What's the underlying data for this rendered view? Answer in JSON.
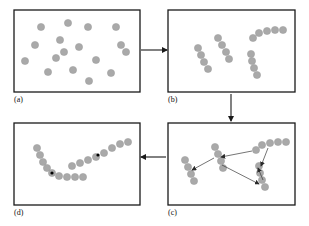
{
  "figure": {
    "background_color": "#ffffff",
    "panel_border_color": "#1a1a1a",
    "dot_color": "#a9a9a9",
    "dot_stroke_color": "#9a9a9a",
    "seed_dot_color": "#000000",
    "arrow_color": "#1a1a1a",
    "inner_arrow_color": "#3a3a3a",
    "dot_radius": 3.6,
    "seed_dot_radius": 1.6,
    "label_color": "#111111"
  },
  "panels": [
    {
      "id": "a",
      "label": "(a)",
      "caption_position": "below-left",
      "box": {
        "x": 14,
        "y": 10,
        "width": 126,
        "height": 82
      },
      "stage": "scattered unlabeled points"
    },
    {
      "id": "b",
      "label": "(b)",
      "caption_position": "below-left",
      "box": {
        "x": 168,
        "y": 10,
        "width": 127,
        "height": 82
      },
      "stage": "points grouped into short chains"
    },
    {
      "id": "c",
      "label": "(c)",
      "caption_position": "below-left",
      "box": {
        "x": 168,
        "y": 123,
        "width": 127,
        "height": 82
      },
      "stage": "chains linked by directed arrows"
    },
    {
      "id": "d",
      "label": "(d)",
      "caption_position": "below-left",
      "box": {
        "x": 14,
        "y": 123,
        "width": 126,
        "height": 82
      },
      "stage": "merged continuous curves"
    }
  ],
  "flow_arrows": [
    {
      "name": "a-to-b",
      "from": "a",
      "to": "b",
      "x1": 141,
      "y1": 50,
      "x2": 167,
      "y2": 50,
      "direction": "right"
    },
    {
      "name": "b-to-c",
      "from": "b",
      "to": "c",
      "x1": 231,
      "y1": 94,
      "x2": 231,
      "y2": 121,
      "direction": "down"
    },
    {
      "name": "c-to-d",
      "from": "c",
      "to": "d",
      "x1": 166,
      "y1": 157,
      "x2": 141,
      "y2": 157,
      "direction": "left"
    }
  ],
  "panel_a_points": [
    [
      41,
      27
    ],
    [
      68,
      23
    ],
    [
      88,
      27
    ],
    [
      116,
      27
    ],
    [
      60,
      40
    ],
    [
      35,
      45
    ],
    [
      79,
      47
    ],
    [
      121,
      45
    ],
    [
      25,
      61
    ],
    [
      56,
      58
    ],
    [
      96,
      60
    ],
    [
      126,
      52
    ],
    [
      48,
      72
    ],
    [
      73,
      70
    ],
    [
      111,
      73
    ],
    [
      89,
      81
    ],
    [
      64,
      52
    ]
  ],
  "panel_b_chains": [
    {
      "name": "chain-left",
      "points": [
        [
          198,
          48
        ],
        [
          201,
          55
        ],
        [
          204,
          62
        ],
        [
          208,
          69
        ]
      ]
    },
    {
      "name": "chain-mid",
      "points": [
        [
          218,
          38
        ],
        [
          222,
          45
        ],
        [
          226,
          52
        ],
        [
          229,
          59
        ]
      ]
    },
    {
      "name": "chain-top-right",
      "points": [
        [
          253,
          38
        ],
        [
          259,
          33
        ],
        [
          267,
          31
        ],
        [
          275,
          30
        ],
        [
          283,
          30
        ]
      ]
    },
    {
      "name": "chain-bottom-right",
      "points": [
        [
          251,
          54
        ],
        [
          252,
          61
        ],
        [
          254,
          68
        ],
        [
          257,
          75
        ]
      ]
    }
  ],
  "panel_c_chains": [
    {
      "name": "chain-left",
      "points": [
        [
          185,
          160
        ],
        [
          188,
          167
        ],
        [
          191,
          174
        ],
        [
          194,
          181
        ]
      ]
    },
    {
      "name": "chain-mid",
      "points": [
        [
          215,
          147
        ],
        [
          218,
          154
        ],
        [
          221,
          161
        ],
        [
          223,
          168
        ]
      ]
    },
    {
      "name": "chain-top-right",
      "points": [
        [
          256,
          150
        ],
        [
          262,
          145
        ],
        [
          270,
          143
        ],
        [
          278,
          142
        ],
        [
          286,
          142
        ]
      ]
    },
    {
      "name": "chain-bottom-right",
      "points": [
        [
          259,
          166
        ],
        [
          260,
          173
        ],
        [
          262,
          180
        ],
        [
          265,
          187
        ]
      ]
    }
  ],
  "panel_c_arrows": [
    {
      "name": "mid-to-left",
      "x1": 214,
      "y1": 158,
      "x2": 192,
      "y2": 170
    },
    {
      "name": "topright-to-mid",
      "x1": 252,
      "y1": 151,
      "x2": 221,
      "y2": 157
    },
    {
      "name": "topright-to-bottomright",
      "x1": 268,
      "y1": 148,
      "x2": 261,
      "y2": 166
    },
    {
      "name": "mid-to-bottomright",
      "x1": 222,
      "y1": 165,
      "x2": 259,
      "y2": 184
    },
    {
      "name": "bottomright-up",
      "x1": 263,
      "y1": 180,
      "x2": 258,
      "y2": 168
    }
  ],
  "panel_d_curves": [
    {
      "name": "curve-lower-left",
      "points": [
        [
          37,
          148
        ],
        [
          40,
          155
        ],
        [
          43,
          162
        ],
        [
          47,
          168
        ],
        [
          52,
          173
        ],
        [
          59,
          176
        ],
        [
          67,
          177
        ],
        [
          75,
          177
        ],
        [
          83,
          177
        ]
      ],
      "seed_index": 4
    },
    {
      "name": "curve-upper-right",
      "points": [
        [
          72,
          166
        ],
        [
          80,
          163
        ],
        [
          88,
          160
        ],
        [
          96,
          157
        ],
        [
          104,
          153
        ],
        [
          112,
          148
        ],
        [
          120,
          144
        ],
        [
          128,
          142
        ]
      ],
      "seed_index": 4
    }
  ],
  "panel_d_seeds": [
    {
      "name": "seed-lower-left",
      "x": 52,
      "y": 173
    },
    {
      "name": "seed-upper-right",
      "x": 98,
      "y": 155
    }
  ]
}
